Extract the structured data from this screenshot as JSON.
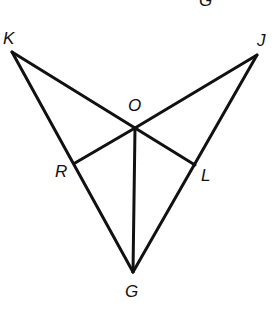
{
  "diagram": {
    "type": "geometry",
    "stroke_color": "#111111",
    "background": "#ffffff",
    "points": {
      "K": {
        "label": "K",
        "x": 12,
        "y": 52
      },
      "J": {
        "label": "J",
        "x": 257,
        "y": 55
      },
      "O": {
        "label": "O",
        "x": 135,
        "y": 128
      },
      "R": {
        "label": "R",
        "x": 75,
        "y": 163
      },
      "L": {
        "label": "L",
        "x": 195,
        "y": 165
      },
      "G": {
        "label": "G",
        "x": 133,
        "y": 272
      }
    },
    "segments": [
      "KO",
      "JO",
      "KG",
      "JG",
      "OG",
      "OR",
      "OL"
    ],
    "partial_top_label": "G"
  }
}
